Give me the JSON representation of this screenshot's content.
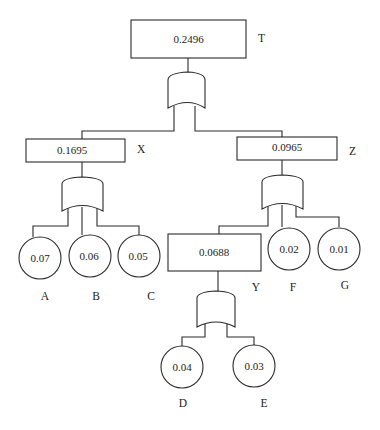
{
  "diagram": {
    "type": "fault-tree",
    "top_event": {
      "id": "T",
      "label": "T",
      "value": "0.2496",
      "gate": "OR"
    },
    "intermediate_events": [
      {
        "id": "X",
        "label": "X",
        "value": "0.1695",
        "gate": "OR",
        "children": [
          "A",
          "B",
          "C"
        ]
      },
      {
        "id": "Z",
        "label": "Z",
        "value": "0.0965",
        "gate": "OR",
        "children": [
          "Y",
          "F",
          "G"
        ]
      },
      {
        "id": "Y",
        "label": "Y",
        "value": "0.0688",
        "gate": "OR",
        "children": [
          "D",
          "E"
        ]
      }
    ],
    "basic_events": [
      {
        "id": "A",
        "label": "A",
        "value": "0.07"
      },
      {
        "id": "B",
        "label": "B",
        "value": "0.06"
      },
      {
        "id": "C",
        "label": "C",
        "value": "0.05"
      },
      {
        "id": "F",
        "label": "F",
        "value": "0.02"
      },
      {
        "id": "G",
        "label": "G",
        "value": "0.01"
      },
      {
        "id": "D",
        "label": "D",
        "value": "0.04"
      },
      {
        "id": "E",
        "label": "E",
        "value": "0.03"
      }
    ],
    "top_children": [
      "X",
      "Z"
    ]
  },
  "nodes": {
    "T": {
      "value": "0.2496",
      "label": "T"
    },
    "X": {
      "value": "0.1695",
      "label": "X"
    },
    "Z": {
      "value": "0.0965",
      "label": "Z"
    },
    "Y": {
      "value": "0.0688",
      "label": "Y"
    },
    "A": {
      "value": "0.07",
      "label": "A"
    },
    "B": {
      "value": "0.06",
      "label": "B"
    },
    "C": {
      "value": "0.05",
      "label": "C"
    },
    "F": {
      "value": "0.02",
      "label": "F"
    },
    "G": {
      "value": "0.01",
      "label": "G"
    },
    "D": {
      "value": "0.04",
      "label": "D"
    },
    "E": {
      "value": "0.03",
      "label": "E"
    }
  },
  "colors": {
    "stroke": "#2a2a2a",
    "background": "#ffffff",
    "text": "#222222"
  }
}
